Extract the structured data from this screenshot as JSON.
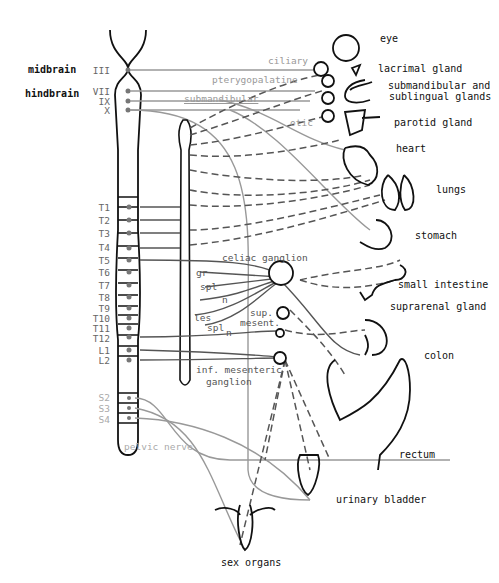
{
  "brain_regions": [
    {
      "label": "midbrain",
      "cranial_nerves": [
        "III"
      ]
    },
    {
      "label": "hindbrain",
      "cranial_nerves": [
        "VII",
        "IX",
        "X"
      ]
    }
  ],
  "cranial_ganglia": [
    "ciliary",
    "pterygopalatine",
    "submandibular",
    "otic"
  ],
  "spinal_segments": [
    "T1",
    "T2",
    "T3",
    "T4",
    "T5",
    "T6",
    "T7",
    "T8",
    "T9",
    "T10",
    "T11",
    "T12",
    "L1",
    "L2"
  ],
  "sacral_segments": [
    "S2",
    "S3",
    "S4"
  ],
  "splanchnic_labels": {
    "greater": [
      "gr",
      "spl",
      "n"
    ],
    "lesser": [
      "les",
      "spl",
      "n"
    ]
  },
  "ganglia": {
    "celiac": "celiac ganglion",
    "sup_mesent": [
      "sup.",
      "mesent."
    ],
    "inf_mesent": [
      "inf. mesenteric",
      "ganglion"
    ]
  },
  "pelvic_nerve": "pelvic nerve",
  "organs": [
    {
      "label": "eye"
    },
    {
      "label": "lacrimal gland"
    },
    {
      "label": "submandibular and sublingual glands",
      "lines": [
        "submandibular and",
        "sublingual glands"
      ]
    },
    {
      "label": "parotid gland"
    },
    {
      "label": "heart"
    },
    {
      "label": "lungs"
    },
    {
      "label": "stomach"
    },
    {
      "label": "small intestine"
    },
    {
      "label": "suprarenal gland"
    },
    {
      "label": "colon"
    },
    {
      "label": "rectum"
    },
    {
      "label": "urinary bladder"
    },
    {
      "label": "sex organs"
    }
  ],
  "colors": {
    "sympathetic_line": "#555555",
    "parasympathetic_line": "#999999",
    "outline": "#111111"
  }
}
